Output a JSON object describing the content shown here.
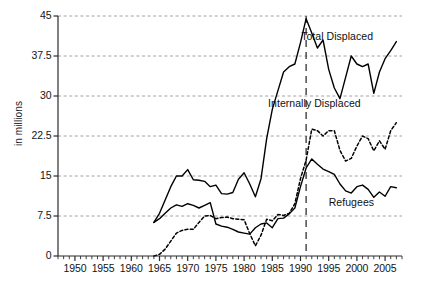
{
  "chart_data": {
    "type": "line",
    "title": "",
    "xlabel": "",
    "ylabel": "in millions",
    "xlim": [
      1947,
      2008
    ],
    "ylim": [
      0,
      45
    ],
    "grid": true,
    "legend_position": "inline-right",
    "y_ticks": [
      "0",
      "7.5",
      "15",
      "22.5",
      "30",
      "37.5",
      "45"
    ],
    "y_tick_values": [
      0,
      7.5,
      15,
      22.5,
      30,
      37.5,
      45
    ],
    "x_ticks": [
      "1950",
      "1955",
      "1960",
      "1965",
      "1970",
      "1975",
      "1980",
      "1985",
      "1990",
      "1995",
      "2000",
      "2005"
    ],
    "x_tick_values": [
      1950,
      1955,
      1960,
      1965,
      1970,
      1975,
      1980,
      1985,
      1990,
      1995,
      2000,
      2005
    ],
    "x_minor_tick_step": 1,
    "annotations": [
      {
        "name": "vertical-reference-line",
        "x": 1991,
        "style": "dashed",
        "color": "#4d4d4d"
      }
    ],
    "series": [
      {
        "name": "Total Displaced",
        "style": "solid",
        "color": "#000000",
        "label_x": 1996.5,
        "label_y": 41.0,
        "x": [
          1964,
          1965,
          1966,
          1967,
          1968,
          1969,
          1970,
          1971,
          1972,
          1973,
          1974,
          1975,
          1976,
          1977,
          1978,
          1979,
          1980,
          1981,
          1982,
          1983,
          1984,
          1985,
          1986,
          1987,
          1988,
          1989,
          1990,
          1991,
          1992,
          1993,
          1994,
          1995,
          1996,
          1997,
          1998,
          1999,
          2000,
          2001,
          2002,
          2003,
          2004,
          2005,
          2006,
          2007
        ],
        "values": [
          6.3,
          8.0,
          10.5,
          13.0,
          15.0,
          15.0,
          16.2,
          14.3,
          14.2,
          14.0,
          13.0,
          13.3,
          11.7,
          11.6,
          11.9,
          14.4,
          15.6,
          13.5,
          11.1,
          14.5,
          22.0,
          27.5,
          31.0,
          34.5,
          35.5,
          36.0,
          40.0,
          44.5,
          41.8,
          39.0,
          40.5,
          35.0,
          31.5,
          29.5,
          33.5,
          37.5,
          36.0,
          35.5,
          36.0,
          30.5,
          34.5,
          37.0,
          38.5,
          40.2
        ]
      },
      {
        "name": "Internally Displaced",
        "style": "dashed",
        "color": "#000000",
        "label_x": 1992.5,
        "label_y": 28.5,
        "x": [
          1964,
          1965,
          1966,
          1967,
          1968,
          1969,
          1970,
          1971,
          1972,
          1973,
          1974,
          1975,
          1976,
          1977,
          1978,
          1979,
          1980,
          1981,
          1982,
          1983,
          1984,
          1985,
          1986,
          1987,
          1988,
          1989,
          1990,
          1991,
          1992,
          1993,
          1994,
          1995,
          1996,
          1997,
          1998,
          1999,
          2000,
          2001,
          2002,
          2003,
          2004,
          2005,
          2006,
          2007
        ],
        "values": [
          0.0,
          0.3,
          1.3,
          2.8,
          4.3,
          4.8,
          5.0,
          5.0,
          6.3,
          7.5,
          7.6,
          7.0,
          7.2,
          7.3,
          7.0,
          6.9,
          6.8,
          4.2,
          1.9,
          3.9,
          6.9,
          6.6,
          7.8,
          7.6,
          8.0,
          9.8,
          14.5,
          18.0,
          23.8,
          23.5,
          22.5,
          23.5,
          23.5,
          19.8,
          17.8,
          18.3,
          20.6,
          22.5,
          22.0,
          19.7,
          21.6,
          20.0,
          23.5,
          25.0
        ]
      },
      {
        "name": "Refugees",
        "style": "solid",
        "color": "#000000",
        "label_x": 1999.0,
        "label_y": 10.0,
        "x": [
          1964,
          1965,
          1966,
          1967,
          1968,
          1969,
          1970,
          1971,
          1972,
          1973,
          1974,
          1975,
          1976,
          1977,
          1978,
          1979,
          1980,
          1981,
          1982,
          1983,
          1984,
          1985,
          1986,
          1987,
          1988,
          1989,
          1990,
          1991,
          1992,
          1993,
          1994,
          1995,
          1996,
          1997,
          1998,
          1999,
          2000,
          2001,
          2002,
          2003,
          2004,
          2005,
          2006,
          2007
        ],
        "values": [
          6.3,
          7.0,
          8.0,
          9.0,
          9.6,
          9.3,
          9.8,
          9.5,
          9.0,
          9.5,
          10.0,
          6.0,
          5.6,
          5.4,
          5.0,
          4.5,
          4.3,
          4.1,
          5.3,
          6.0,
          6.2,
          5.3,
          7.0,
          7.1,
          7.9,
          9.0,
          13.0,
          16.5,
          18.2,
          17.2,
          16.3,
          15.8,
          15.3,
          13.5,
          12.2,
          11.8,
          13.0,
          13.3,
          12.5,
          11.0,
          12.0,
          11.2,
          13.0,
          12.8
        ]
      }
    ]
  },
  "axes": {
    "y_label": "in millions"
  }
}
